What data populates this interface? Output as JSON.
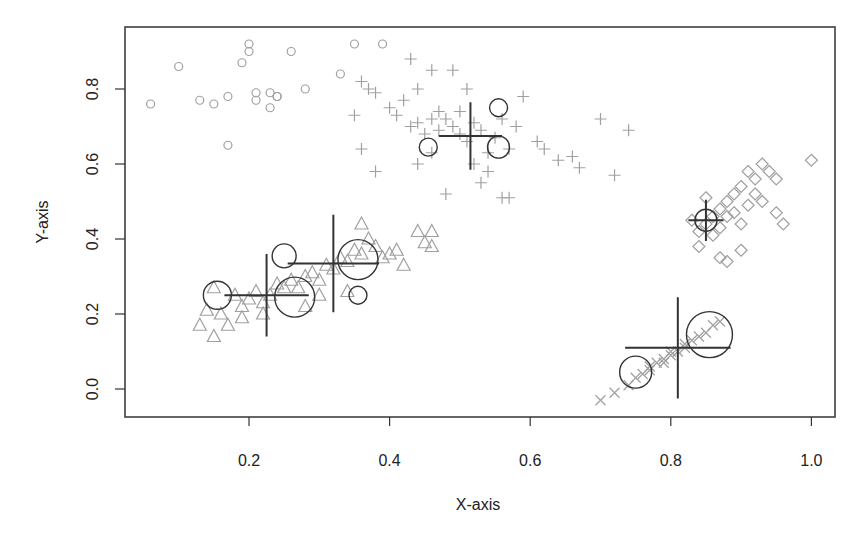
{
  "chart_data": {
    "type": "scatter",
    "title": "",
    "xlabel": "X-axis",
    "ylabel": "Y-axis",
    "xlim": [
      0.04,
      1.02
    ],
    "ylim": [
      -0.075,
      0.965
    ],
    "xticks": [
      0.2,
      0.4,
      0.6,
      0.8,
      1.0
    ],
    "xtick_labels": [
      "0.2",
      "0.4",
      "0.6",
      "0.8",
      "1.0"
    ],
    "yticks": [
      0.0,
      0.2,
      0.4,
      0.6,
      0.8
    ],
    "ytick_labels": [
      "0.0",
      "0.2",
      "0.4",
      "0.6",
      "0.8"
    ],
    "grid": false,
    "legend": null,
    "point_color": "#a0a0a0",
    "overlay_color": "#333333",
    "series": [
      {
        "name": "cluster-circles",
        "marker": "circle",
        "points": [
          [
            0.06,
            0.76
          ],
          [
            0.1,
            0.86
          ],
          [
            0.13,
            0.77
          ],
          [
            0.15,
            0.76
          ],
          [
            0.17,
            0.65
          ],
          [
            0.17,
            0.78
          ],
          [
            0.19,
            0.87
          ],
          [
            0.2,
            0.9
          ],
          [
            0.2,
            0.92
          ],
          [
            0.21,
            0.79
          ],
          [
            0.21,
            0.77
          ],
          [
            0.23,
            0.79
          ],
          [
            0.23,
            0.75
          ],
          [
            0.24,
            0.78
          ],
          [
            0.24,
            0.78
          ],
          [
            0.26,
            0.9
          ],
          [
            0.28,
            0.8
          ],
          [
            0.33,
            0.84
          ],
          [
            0.35,
            0.92
          ],
          [
            0.39,
            0.92
          ]
        ]
      },
      {
        "name": "cluster-plus",
        "marker": "plus",
        "points": [
          [
            0.36,
            0.82
          ],
          [
            0.37,
            0.8
          ],
          [
            0.35,
            0.73
          ],
          [
            0.38,
            0.79
          ],
          [
            0.4,
            0.75
          ],
          [
            0.41,
            0.73
          ],
          [
            0.42,
            0.77
          ],
          [
            0.43,
            0.7
          ],
          [
            0.44,
            0.71
          ],
          [
            0.45,
            0.68
          ],
          [
            0.46,
            0.72
          ],
          [
            0.47,
            0.69
          ],
          [
            0.47,
            0.74
          ],
          [
            0.48,
            0.72
          ],
          [
            0.49,
            0.7
          ],
          [
            0.5,
            0.68
          ],
          [
            0.5,
            0.74
          ],
          [
            0.51,
            0.66
          ],
          [
            0.52,
            0.71
          ],
          [
            0.53,
            0.69
          ],
          [
            0.54,
            0.63
          ],
          [
            0.55,
            0.67
          ],
          [
            0.56,
            0.72
          ],
          [
            0.57,
            0.64
          ],
          [
            0.58,
            0.7
          ],
          [
            0.59,
            0.78
          ],
          [
            0.61,
            0.66
          ],
          [
            0.62,
            0.64
          ],
          [
            0.64,
            0.61
          ],
          [
            0.66,
            0.62
          ],
          [
            0.67,
            0.59
          ],
          [
            0.7,
            0.72
          ],
          [
            0.74,
            0.69
          ],
          [
            0.72,
            0.57
          ],
          [
            0.46,
            0.85
          ],
          [
            0.49,
            0.85
          ],
          [
            0.51,
            0.8
          ],
          [
            0.44,
            0.8
          ],
          [
            0.43,
            0.88
          ],
          [
            0.36,
            0.64
          ],
          [
            0.38,
            0.58
          ],
          [
            0.48,
            0.52
          ],
          [
            0.53,
            0.55
          ],
          [
            0.56,
            0.51
          ],
          [
            0.57,
            0.51
          ],
          [
            0.44,
            0.6
          ],
          [
            0.46,
            0.63
          ],
          [
            0.52,
            0.6
          ],
          [
            0.54,
            0.58
          ]
        ]
      },
      {
        "name": "cluster-triangles",
        "marker": "triangle",
        "points": [
          [
            0.13,
            0.17
          ],
          [
            0.14,
            0.21
          ],
          [
            0.15,
            0.14
          ],
          [
            0.16,
            0.2
          ],
          [
            0.17,
            0.17
          ],
          [
            0.18,
            0.25
          ],
          [
            0.19,
            0.22
          ],
          [
            0.2,
            0.24
          ],
          [
            0.21,
            0.26
          ],
          [
            0.22,
            0.23
          ],
          [
            0.23,
            0.25
          ],
          [
            0.24,
            0.28
          ],
          [
            0.25,
            0.27
          ],
          [
            0.26,
            0.29
          ],
          [
            0.27,
            0.27
          ],
          [
            0.28,
            0.3
          ],
          [
            0.29,
            0.31
          ],
          [
            0.3,
            0.29
          ],
          [
            0.31,
            0.33
          ],
          [
            0.32,
            0.32
          ],
          [
            0.33,
            0.35
          ],
          [
            0.34,
            0.34
          ],
          [
            0.35,
            0.37
          ],
          [
            0.36,
            0.36
          ],
          [
            0.37,
            0.4
          ],
          [
            0.38,
            0.38
          ],
          [
            0.39,
            0.35
          ],
          [
            0.4,
            0.36
          ],
          [
            0.41,
            0.37
          ],
          [
            0.42,
            0.33
          ],
          [
            0.44,
            0.42
          ],
          [
            0.45,
            0.39
          ],
          [
            0.46,
            0.38
          ],
          [
            0.46,
            0.42
          ],
          [
            0.36,
            0.44
          ],
          [
            0.15,
            0.27
          ],
          [
            0.19,
            0.19
          ],
          [
            0.22,
            0.2
          ],
          [
            0.28,
            0.22
          ],
          [
            0.3,
            0.25
          ],
          [
            0.34,
            0.26
          ]
        ]
      },
      {
        "name": "cluster-diamonds",
        "marker": "diamond",
        "points": [
          [
            0.84,
            0.42
          ],
          [
            0.84,
            0.38
          ],
          [
            0.85,
            0.44
          ],
          [
            0.86,
            0.46
          ],
          [
            0.86,
            0.41
          ],
          [
            0.87,
            0.48
          ],
          [
            0.87,
            0.43
          ],
          [
            0.88,
            0.5
          ],
          [
            0.88,
            0.46
          ],
          [
            0.89,
            0.52
          ],
          [
            0.89,
            0.47
          ],
          [
            0.9,
            0.44
          ],
          [
            0.9,
            0.54
          ],
          [
            0.91,
            0.49
          ],
          [
            0.91,
            0.58
          ],
          [
            0.92,
            0.52
          ],
          [
            0.92,
            0.56
          ],
          [
            0.93,
            0.5
          ],
          [
            0.93,
            0.6
          ],
          [
            0.94,
            0.58
          ],
          [
            0.95,
            0.47
          ],
          [
            0.95,
            0.56
          ],
          [
            0.96,
            0.44
          ],
          [
            0.87,
            0.35
          ],
          [
            0.88,
            0.34
          ],
          [
            0.9,
            0.37
          ],
          [
            0.83,
            0.45
          ],
          [
            0.85,
            0.51
          ],
          [
            1.0,
            0.61
          ]
        ]
      },
      {
        "name": "cluster-x",
        "marker": "cross",
        "points": [
          [
            0.7,
            -0.03
          ],
          [
            0.72,
            -0.01
          ],
          [
            0.74,
            0.01
          ],
          [
            0.75,
            0.03
          ],
          [
            0.76,
            0.04
          ],
          [
            0.77,
            0.06
          ],
          [
            0.78,
            0.07
          ],
          [
            0.79,
            0.08
          ],
          [
            0.8,
            0.09
          ],
          [
            0.81,
            0.1
          ],
          [
            0.82,
            0.12
          ],
          [
            0.83,
            0.13
          ],
          [
            0.84,
            0.14
          ],
          [
            0.85,
            0.15
          ],
          [
            0.86,
            0.17
          ],
          [
            0.87,
            0.18
          ],
          [
            0.79,
            0.07
          ],
          [
            0.8,
            0.1
          ],
          [
            0.82,
            0.11
          ],
          [
            0.77,
            0.05
          ]
        ]
      }
    ],
    "overlays": {
      "centroid_crosses": [
        {
          "x": 0.225,
          "y": 0.25,
          "hx": 0.06,
          "vy": 0.11
        },
        {
          "x": 0.32,
          "y": 0.335,
          "hx": 0.065,
          "vy": 0.13
        },
        {
          "x": 0.515,
          "y": 0.675,
          "hx": 0.045,
          "vy": 0.09
        },
        {
          "x": 0.85,
          "y": 0.45,
          "hx": 0.025,
          "vy": 0.055
        },
        {
          "x": 0.81,
          "y": 0.11,
          "hx": 0.075,
          "vy": 0.135
        }
      ],
      "rings": [
        {
          "x": 0.155,
          "y": 0.25,
          "r": 14
        },
        {
          "x": 0.25,
          "y": 0.355,
          "r": 12
        },
        {
          "x": 0.265,
          "y": 0.245,
          "r": 20
        },
        {
          "x": 0.355,
          "y": 0.345,
          "r": 20
        },
        {
          "x": 0.355,
          "y": 0.25,
          "r": 9
        },
        {
          "x": 0.455,
          "y": 0.645,
          "r": 9
        },
        {
          "x": 0.555,
          "y": 0.75,
          "r": 9
        },
        {
          "x": 0.555,
          "y": 0.645,
          "r": 11
        },
        {
          "x": 0.85,
          "y": 0.45,
          "r": 11
        },
        {
          "x": 0.75,
          "y": 0.045,
          "r": 16
        },
        {
          "x": 0.855,
          "y": 0.145,
          "r": 23
        }
      ]
    }
  }
}
